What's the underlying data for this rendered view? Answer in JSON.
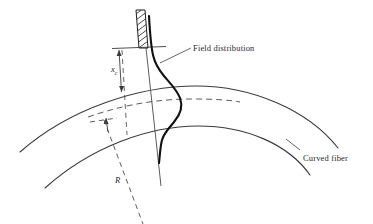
{
  "figure": {
    "type": "technical-line-diagram",
    "background_color": "#ffffff",
    "line_color": "#3a3a3a",
    "field_curve_color": "#111111",
    "text_color": "#2a2a2a",
    "labels": {
      "field_distribution": "Field distribution",
      "curved_fiber": "Curved fiber",
      "caustic_radius_symbol": "x",
      "caustic_radius_subscript": "c",
      "bend_radius_symbol": "R"
    },
    "elements": {
      "outer_core_boundary": "solid arc (upper fiber boundary)",
      "inner_core_boundary": "solid arc (lower fiber boundary)",
      "fiber_axis": "dashed arc (fiber center axis)",
      "hatched_block": "cross-hatched bar (index/radiation barrier at fiber top)",
      "dimension_arrow": "double-headed vertical arrow marking caustic distance",
      "radius_line": "dashed line toward center of curvature",
      "leader_line": "pointer from field curve to its label",
      "vertical_reference_line": "thin solid line along local radial direction"
    }
  }
}
